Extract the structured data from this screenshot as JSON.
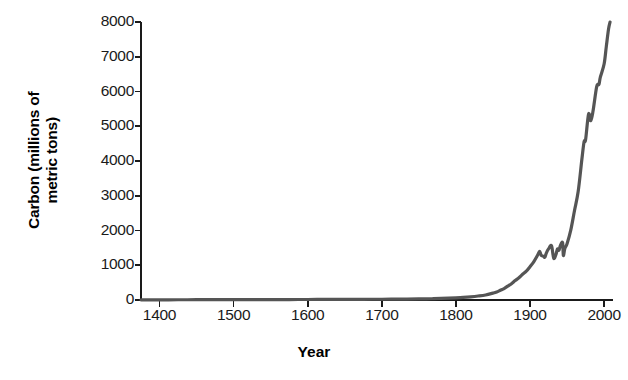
{
  "chart_data": {
    "type": "line",
    "title": "",
    "xlabel": "Year",
    "ylabel": "Carbon (millions of metric tons)",
    "ylabel_line1": "Carbon (millions of",
    "ylabel_line2": "metric tons)",
    "xlim": [
      1375,
      2012
    ],
    "ylim": [
      0,
      8000
    ],
    "xticks": [
      1400,
      1500,
      1600,
      1700,
      1800,
      1900,
      2000
    ],
    "xtick_labels": [
      "1400",
      "1500",
      "1600",
      "1700",
      "1800",
      "1900",
      "2000"
    ],
    "yticks": [
      0,
      1000,
      2000,
      3000,
      4000,
      5000,
      6000,
      7000,
      8000
    ],
    "ytick_labels": [
      "0",
      "1000",
      "2000",
      "3000",
      "4000",
      "5000",
      "6000",
      "7000",
      "8000"
    ],
    "grid": false,
    "legend": "none",
    "line_color": "#555555",
    "axis_color": "#1a1a1a",
    "background": "#ffffff",
    "series": [
      {
        "name": "Global carbon emissions",
        "x": [
          1375,
          1400,
          1425,
          1450,
          1475,
          1500,
          1525,
          1550,
          1575,
          1600,
          1625,
          1650,
          1675,
          1700,
          1725,
          1750,
          1760,
          1770,
          1780,
          1790,
          1800,
          1810,
          1820,
          1830,
          1840,
          1850,
          1855,
          1860,
          1865,
          1870,
          1875,
          1880,
          1885,
          1890,
          1895,
          1900,
          1905,
          1910,
          1913,
          1915,
          1918,
          1920,
          1922,
          1925,
          1929,
          1932,
          1935,
          1937,
          1939,
          1941,
          1944,
          1945,
          1947,
          1950,
          1955,
          1960,
          1965,
          1970,
          1973,
          1975,
          1979,
          1982,
          1985,
          1990,
          1993,
          1995,
          2000,
          2003,
          2006,
          2008
        ],
        "y": [
          5,
          6,
          7,
          8,
          9,
          10,
          11,
          12,
          13,
          15,
          16,
          18,
          20,
          22,
          25,
          30,
          33,
          38,
          44,
          52,
          62,
          75,
          92,
          115,
          145,
          198,
          230,
          280,
          330,
          400,
          470,
          560,
          640,
          740,
          830,
          960,
          1100,
          1280,
          1400,
          1290,
          1260,
          1230,
          1350,
          1470,
          1560,
          1200,
          1310,
          1470,
          1430,
          1570,
          1650,
          1280,
          1480,
          1620,
          2010,
          2570,
          3120,
          4050,
          4560,
          4610,
          5350,
          5160,
          5430,
          6140,
          6200,
          6420,
          6790,
          7300,
          7800,
          8000
        ]
      }
    ],
    "annotations": []
  },
  "axis": {
    "y_title_line1": "Carbon (millions of",
    "y_title_line2": "metric tons)",
    "x_title": "Year"
  }
}
